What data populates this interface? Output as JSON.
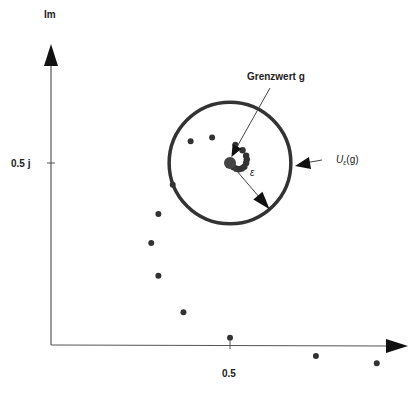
{
  "diagram": {
    "axes": {
      "imag_label": "Im",
      "real_tick_label": "0.5",
      "imag_tick_label": "0.5 j",
      "real_tick_value": 0.5,
      "imag_tick_value": 0.5
    },
    "limit": {
      "label": "Grenzwert g",
      "re": 0.5,
      "im": 0.5
    },
    "neighborhood": {
      "label_main": "U",
      "label_sub": "ε",
      "label_tail": "(g)",
      "radius": 0.17
    },
    "epsilon_label": "ε",
    "colors": {
      "ink": "#333333",
      "axis": "#555555",
      "background": "#ffffff"
    },
    "sequence_points": [
      {
        "re": 0.91,
        "im": -0.05
      },
      {
        "re": 0.74,
        "im": -0.03
      },
      {
        "re": 0.5,
        "im": 0.02
      },
      {
        "re": 0.37,
        "im": 0.09
      },
      {
        "re": 0.3,
        "im": 0.19
      },
      {
        "re": 0.28,
        "im": 0.28
      },
      {
        "re": 0.3,
        "im": 0.36
      },
      {
        "re": 0.34,
        "im": 0.44
      },
      {
        "re": 0.39,
        "im": 0.56
      },
      {
        "re": 0.45,
        "im": 0.57
      },
      {
        "re": 0.515,
        "im": 0.55
      },
      {
        "re": 0.535,
        "im": 0.535
      },
      {
        "re": 0.545,
        "im": 0.52
      },
      {
        "re": 0.547,
        "im": 0.51
      },
      {
        "re": 0.545,
        "im": 0.5
      },
      {
        "re": 0.54,
        "im": 0.49
      },
      {
        "re": 0.533,
        "im": 0.485
      },
      {
        "re": 0.525,
        "im": 0.483
      },
      {
        "re": 0.518,
        "im": 0.484
      },
      {
        "re": 0.51,
        "im": 0.488
      }
    ]
  }
}
